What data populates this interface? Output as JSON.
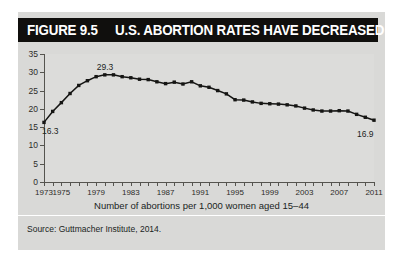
{
  "figure": {
    "number": "FIGURE 9.5",
    "title": "U.S. ABORTION RATES HAVE DECREASED",
    "source": "Source: Guttmacher Institute, 2014."
  },
  "chart_data": {
    "type": "line",
    "title": "U.S. ABORTION RATES HAVE DECREASED",
    "xlabel": "Number of abortions per 1,000 women aged 15–44",
    "ylabel": "",
    "xlim": [
      1973,
      2011
    ],
    "ylim": [
      0,
      35
    ],
    "grid": false,
    "legend": false,
    "marker": "square",
    "line_color": "#151513",
    "y_ticks": [
      0,
      5,
      10,
      15,
      20,
      25,
      30,
      35
    ],
    "x_ticks": [
      1973,
      1974,
      1975,
      1976,
      1977,
      1978,
      1979,
      1980,
      1981,
      1982,
      1983,
      1984,
      1985,
      1986,
      1987,
      1988,
      1989,
      1990,
      1991,
      1992,
      1993,
      1994,
      1995,
      1996,
      1997,
      1998,
      1999,
      2000,
      2001,
      2002,
      2003,
      2004,
      2005,
      2006,
      2007,
      2008,
      2009,
      2010,
      2011
    ],
    "x_tick_labels": [
      {
        "value": 1973,
        "label": "1973"
      },
      {
        "value": 1975,
        "label": "1975"
      },
      {
        "value": 1979,
        "label": "1979"
      },
      {
        "value": 1983,
        "label": "1983"
      },
      {
        "value": 1987,
        "label": "1987"
      },
      {
        "value": 1991,
        "label": "1991"
      },
      {
        "value": 1995,
        "label": "1995"
      },
      {
        "value": 1999,
        "label": "1999"
      },
      {
        "value": 2003,
        "label": "2003"
      },
      {
        "value": 2007,
        "label": "2007"
      },
      {
        "value": 2011,
        "label": "2011"
      }
    ],
    "x": [
      1973,
      1974,
      1975,
      1976,
      1977,
      1978,
      1979,
      1980,
      1981,
      1982,
      1983,
      1984,
      1985,
      1986,
      1987,
      1988,
      1989,
      1990,
      1991,
      1992,
      1993,
      1994,
      1995,
      1996,
      1997,
      1998,
      1999,
      2000,
      2001,
      2002,
      2003,
      2004,
      2005,
      2006,
      2007,
      2008,
      2009,
      2010,
      2011
    ],
    "values": [
      16.3,
      19.3,
      21.7,
      24.2,
      26.4,
      27.7,
      28.8,
      29.3,
      29.3,
      28.8,
      28.5,
      28.1,
      28.0,
      27.4,
      26.9,
      27.3,
      26.8,
      27.4,
      26.3,
      25.9,
      25.0,
      24.1,
      22.5,
      22.4,
      21.9,
      21.5,
      21.4,
      21.3,
      21.1,
      20.8,
      20.2,
      19.7,
      19.4,
      19.4,
      19.5,
      19.4,
      18.5,
      17.7,
      16.9
    ],
    "annotations": [
      {
        "text": "16.3",
        "x": 1973,
        "y": 16.3,
        "position": "below-right"
      },
      {
        "text": "29.3",
        "x": 1980,
        "y": 29.3,
        "position": "above"
      },
      {
        "text": "16.9",
        "x": 2011,
        "y": 16.9,
        "position": "below-left"
      }
    ]
  }
}
